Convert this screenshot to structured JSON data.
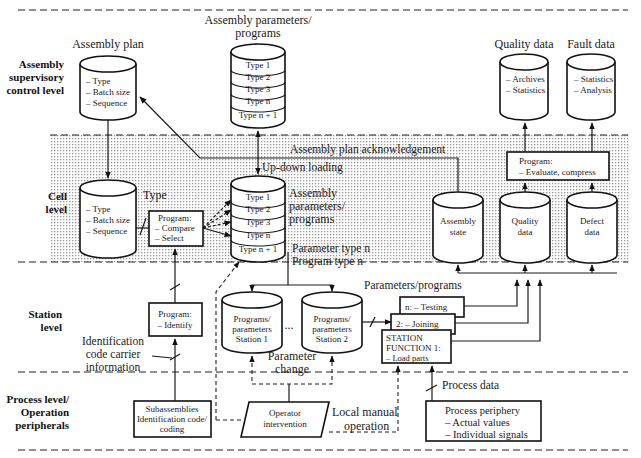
{
  "levels": {
    "supervisory": "Assembly supervisory control level",
    "supervisory_lines": [
      "Assembly",
      "supervisory",
      "control level"
    ],
    "cell_lines": [
      "Cell",
      "level"
    ],
    "station_lines": [
      "Station",
      "level"
    ],
    "process_lines": [
      "Process level/",
      "Operation",
      "peripherals"
    ]
  },
  "supervisory": {
    "assembly_plan": {
      "title": "Assembly plan",
      "items": [
        "– Type",
        "– Batch size",
        "– Sequence"
      ]
    },
    "assembly_params": {
      "title_lines": [
        "Assembly parameters/",
        "programs"
      ],
      "types": [
        "Type 1",
        "Type 2",
        "Type 3",
        "Type n",
        "Type n + 1"
      ]
    },
    "quality_data": {
      "title": "Quality data",
      "items": [
        "– Archives",
        "– Statistics"
      ]
    },
    "fault_data": {
      "title": "Fault data",
      "items": [
        "– Statistics",
        "– Analysis"
      ]
    }
  },
  "cell": {
    "assembly_plan_copy": {
      "items": [
        "– Type",
        "– Batch size",
        "– Sequence"
      ]
    },
    "type_label": "Type",
    "program_compare": {
      "title": "Program:",
      "items": [
        "– Compare",
        "– Select"
      ]
    },
    "params_db": {
      "types": [
        "Type 1",
        "Type 2",
        "Type 3",
        "Type n",
        "Type n + 1"
      ],
      "label_lines": [
        "Assembly",
        "parameters/",
        "programs"
      ]
    },
    "ack_label": "Assembly plan acknowledgement",
    "updown_label": "Up-down loading",
    "param_type_label": "Parameter type n",
    "program_type_label": "Program type n",
    "program_evaluate": {
      "title": "Program:",
      "items": [
        "– Evaluate, compress"
      ]
    },
    "assembly_state": {
      "lines": [
        "Assembly",
        "state"
      ]
    },
    "quality_data": {
      "lines": [
        "Quality",
        "data"
      ]
    },
    "defect_data": {
      "lines": [
        "Defect",
        "data"
      ]
    }
  },
  "station": {
    "program_identify": {
      "title": "Program:",
      "items": [
        "– Identify"
      ]
    },
    "id_code_label_lines": [
      "Identification",
      "code carrier",
      "information"
    ],
    "station1": {
      "lines": [
        "Programs/",
        "parameters",
        "Station 1"
      ]
    },
    "ellipsis": "...",
    "station2": {
      "lines": [
        "Programs/",
        "parameters",
        "Station 2"
      ]
    },
    "param_change_lines": [
      "Parameter",
      "change"
    ],
    "params_programs_label": "Parameters/programs",
    "function_n": "n: – Testing",
    "function_2": "2: – Joining",
    "function_1_lines": [
      "STATION",
      "FUNCTION 1:",
      "– Load parts"
    ]
  },
  "process": {
    "subassemblies_lines": [
      "Subassemblies",
      "Identification code/",
      "coding"
    ],
    "operator_lines": [
      "Operator",
      "intervention"
    ],
    "local_manual_lines": [
      "Local manual",
      "operation"
    ],
    "process_data_label": "Process data",
    "periphery": {
      "title": "Process periphery",
      "items": [
        "– Actual values",
        "– Individual signals"
      ]
    }
  }
}
